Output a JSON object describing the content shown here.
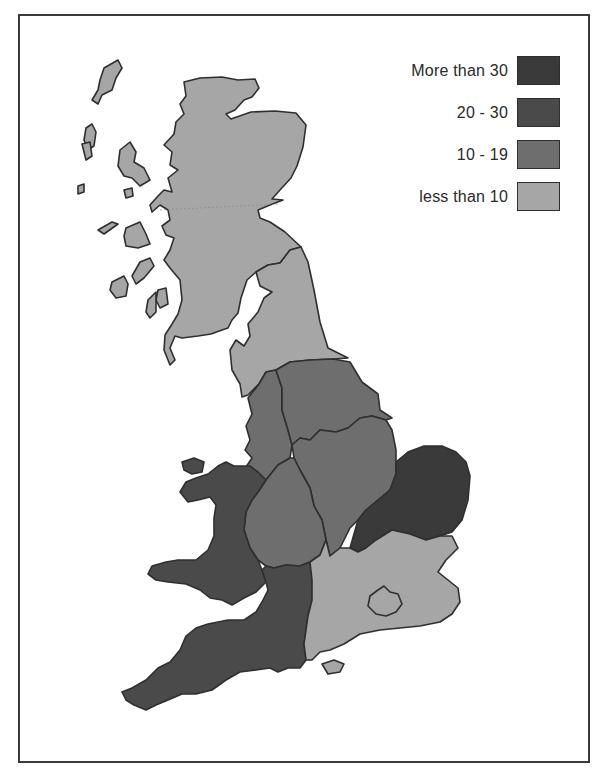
{
  "map": {
    "subject": "Great Britain regions choropleth",
    "classes": [
      {
        "id": "c4",
        "label": "More than 30",
        "color": "#3a3a3a"
      },
      {
        "id": "c3",
        "label": "20 - 30",
        "color": "#4a4a4a"
      },
      {
        "id": "c2",
        "label": "10 - 19",
        "color": "#6e6e6e"
      },
      {
        "id": "c1",
        "label": "less than 10",
        "color": "#a6a6a6"
      }
    ],
    "regions": [
      {
        "name": "Scotland",
        "class": "less than 10"
      },
      {
        "name": "North",
        "class": "less than 10"
      },
      {
        "name": "North West",
        "class": "10 - 19"
      },
      {
        "name": "Yorkshire and Humberside",
        "class": "10 - 19"
      },
      {
        "name": "East Midlands",
        "class": "10 - 19"
      },
      {
        "name": "West Midlands",
        "class": "10 - 19"
      },
      {
        "name": "Wales",
        "class": "20 - 30"
      },
      {
        "name": "South West",
        "class": "20 - 30"
      },
      {
        "name": "East Anglia",
        "class": "More than 30"
      },
      {
        "name": "South East",
        "class": "less than 10"
      },
      {
        "name": "Greater London",
        "class": "less than 10"
      }
    ]
  },
  "legend": {
    "items": [
      {
        "label": "More than 30",
        "color": "#3a3a3a"
      },
      {
        "label": "20 - 30",
        "color": "#4a4a4a"
      },
      {
        "label": "10 - 19",
        "color": "#6e6e6e"
      },
      {
        "label": "less than 10",
        "color": "#a6a6a6"
      }
    ]
  }
}
